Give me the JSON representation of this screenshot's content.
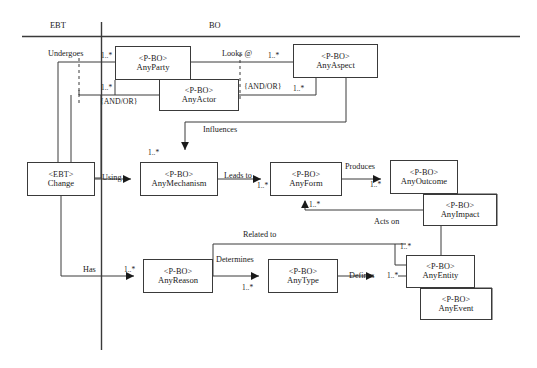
{
  "figure": {
    "caption_faint": "",
    "columns": [
      {
        "id": "ebt",
        "label": "EBT"
      },
      {
        "id": "bo",
        "label": "BO"
      }
    ]
  },
  "boxes": [
    {
      "id": "anyparty",
      "stereotype": "<P-BO>",
      "name": "AnyParty",
      "x": 115,
      "y": 46,
      "w": 76,
      "h": 34
    },
    {
      "id": "anyactor",
      "stereotype": "<P-BO>",
      "name": "AnyActor",
      "x": 159,
      "y": 79,
      "w": 80,
      "h": 32
    },
    {
      "id": "anyaspect",
      "stereotype": "<P-BO>",
      "name": "AnyAspect",
      "x": 293,
      "y": 44,
      "w": 85,
      "h": 34
    },
    {
      "id": "change",
      "stereotype": "<EBT>",
      "name": "Change",
      "x": 27,
      "y": 162,
      "w": 68,
      "h": 34
    },
    {
      "id": "anymechanism",
      "stereotype": "<P-BO>",
      "name": "AnyMechanism",
      "x": 140,
      "y": 162,
      "w": 78,
      "h": 34
    },
    {
      "id": "anyform",
      "stereotype": "<P-BO>",
      "name": "AnyForm",
      "x": 270,
      "y": 162,
      "w": 72,
      "h": 34
    },
    {
      "id": "anyoutcome",
      "stereotype": "<P-BO>",
      "name": "AnyOutcome",
      "x": 390,
      "y": 160,
      "w": 68,
      "h": 34
    },
    {
      "id": "anyimpact",
      "stereotype": "<P-BO>",
      "name": "AnyImpact",
      "x": 423,
      "y": 194,
      "w": 74,
      "h": 32
    },
    {
      "id": "anyreason",
      "stereotype": "<P-BO>",
      "name": "AnyReason",
      "x": 143,
      "y": 259,
      "w": 70,
      "h": 34
    },
    {
      "id": "anytype",
      "stereotype": "<P-BO>",
      "name": "AnyType",
      "x": 268,
      "y": 259,
      "w": 70,
      "h": 34
    },
    {
      "id": "anyentity",
      "stereotype": "<P-BO>",
      "name": "AnyEntity",
      "x": 406,
      "y": 255,
      "w": 69,
      "h": 33
    },
    {
      "id": "anyevent",
      "stereotype": "<P-BO>",
      "name": "AnyEvent",
      "x": 420,
      "y": 288,
      "w": 72,
      "h": 32
    }
  ],
  "relationships": [
    {
      "id": "undergoes",
      "label": "Undergoes",
      "x": 48,
      "y": 50,
      "multiplicity": "1..*",
      "mx": 101,
      "my": 52
    },
    {
      "id": "looks-at",
      "label": "Looks @",
      "x": 222,
      "y": 50,
      "multiplicity": "1..*",
      "mx": 268,
      "my": 52
    },
    {
      "id": "influences",
      "label": "Influences",
      "x": 203,
      "y": 126,
      "multiplicity": "1..*",
      "mx": 148,
      "my": 149
    },
    {
      "id": "using",
      "label": "Using",
      "x": 102,
      "y": 174,
      "multiplicity": "",
      "mx": 0,
      "my": 0
    },
    {
      "id": "leads-to",
      "label": "Leads to",
      "x": 224,
      "y": 172,
      "multiplicity": "1..*",
      "mx": 257,
      "my": 182
    },
    {
      "id": "produces",
      "label": "Produces",
      "x": 345,
      "y": 163,
      "multiplicity": "1..*",
      "mx": 370,
      "my": 181
    },
    {
      "id": "acts-on",
      "label": "Acts on",
      "x": 374,
      "y": 218,
      "multiplicity": "1..*",
      "mx": 400,
      "my": 243
    },
    {
      "id": "related-to",
      "label": "Related to",
      "x": 243,
      "y": 231,
      "multiplicity": "1..*",
      "mx": 347,
      "my": 202
    },
    {
      "id": "has",
      "label": "Has",
      "x": 83,
      "y": 266,
      "multiplicity": "1..*",
      "mx": 124,
      "my": 266
    },
    {
      "id": "determines",
      "label": "Determines",
      "x": 216,
      "y": 256,
      "multiplicity": "1..*",
      "mx": 242,
      "my": 277
    },
    {
      "id": "defines",
      "label": "Defines",
      "x": 349,
      "y": 278,
      "multiplicity": "1..*",
      "mx": 387,
      "my": 278
    }
  ],
  "multiplicity_extra": [
    {
      "id": "party-andor-mult",
      "text": "1..*",
      "x": 101,
      "y": 88
    },
    {
      "id": "aspect-lower-mult",
      "text": "1..*",
      "x": 293,
      "y": 86
    }
  ],
  "constraints": [
    {
      "id": "andor-left",
      "text": "{AND/OR}",
      "x": 100,
      "y": 100
    },
    {
      "id": "andor-right",
      "text": "{AND/OR}",
      "x": 242,
      "y": 83
    }
  ],
  "colors": {
    "stroke": "#3a3a3a",
    "box_fill": "#ffffff",
    "text": "#1a1a1a",
    "background": "#ffffff"
  }
}
